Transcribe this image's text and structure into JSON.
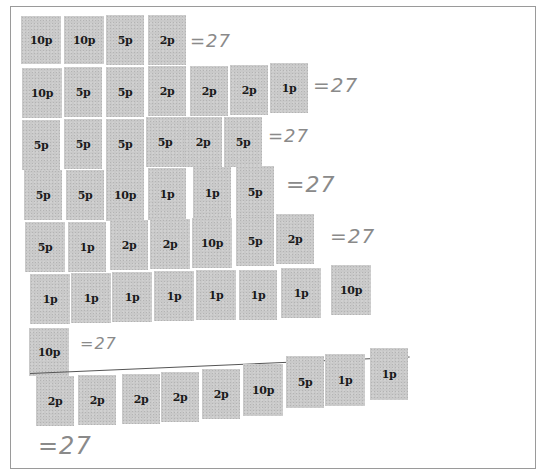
{
  "worksheet": {
    "rows": [
      {
        "stamps": [
          "10p",
          "10p",
          "5p",
          "2p"
        ],
        "total": "=27"
      },
      {
        "stamps": [
          "10p",
          "5p",
          "5p",
          "2p",
          "2p",
          "2p",
          "1p"
        ],
        "total": "=27"
      },
      {
        "stamps": [
          "5p",
          "5p",
          "5p",
          "5p",
          "2p",
          "5p"
        ],
        "total": "=27"
      },
      {
        "stamps": [
          "5p",
          "5p",
          "10p",
          "1p",
          "1p",
          "5p"
        ],
        "total": "=27"
      },
      {
        "stamps": [
          "5p",
          "1p",
          "2p",
          "2p",
          "10p",
          "5p",
          "2p"
        ],
        "total": "=27"
      },
      {
        "stamps": [
          "1p",
          "1p",
          "1p",
          "1p",
          "1p",
          "1p",
          "1p",
          "10p"
        ],
        "total": ""
      },
      {
        "stamps": [
          "10p"
        ],
        "total": "=27"
      },
      {
        "stamps": [
          "2p",
          "2p",
          "2p",
          "2p",
          "2p",
          "10p",
          "5p",
          "1p",
          "1p"
        ],
        "total": "=27"
      }
    ]
  },
  "colors": {
    "stamp_fill": "#c9c9c9",
    "stamp_text": "#1a1a1a",
    "pencil": "#8a8a8a",
    "border": "#9a9a9a"
  }
}
